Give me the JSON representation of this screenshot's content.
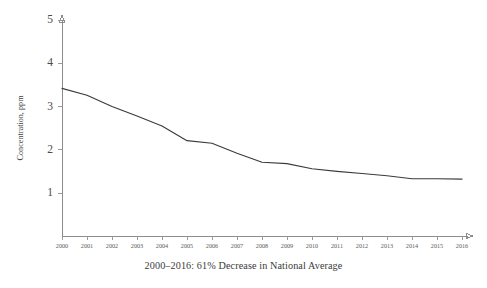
{
  "chart_data": {
    "type": "line",
    "title": "",
    "subtitle": "",
    "caption": "2000–2016:  61% Decrease in National Average",
    "xlabel": "",
    "ylabel": "Concentration, ppm",
    "x": [
      2000,
      2001,
      2002,
      2003,
      2004,
      2005,
      2006,
      2007,
      2008,
      2009,
      2010,
      2011,
      2012,
      2013,
      2014,
      2015,
      2016
    ],
    "categories": [
      "2000",
      "2001",
      "2002",
      "2003",
      "2004",
      "2005",
      "2006",
      "2007",
      "2008",
      "2009",
      "2010",
      "2011",
      "2012",
      "2013",
      "2014",
      "2015",
      "2016"
    ],
    "values": [
      3.42,
      3.26,
      3.0,
      2.78,
      2.55,
      2.21,
      2.15,
      1.92,
      1.71,
      1.68,
      1.56,
      1.5,
      1.45,
      1.4,
      1.33,
      1.33,
      1.32
    ],
    "series": [
      {
        "name": "National Average Concentration",
        "values": [
          3.42,
          3.26,
          3.0,
          2.78,
          2.55,
          2.21,
          2.15,
          1.92,
          1.71,
          1.68,
          1.56,
          1.5,
          1.45,
          1.4,
          1.33,
          1.33,
          1.32
        ]
      }
    ],
    "ylim": [
      0,
      5
    ],
    "xlim": [
      2000,
      2016
    ],
    "yticks": [
      1,
      2,
      3,
      4,
      5
    ],
    "ytick_labels": [
      "1",
      "2",
      "3",
      "4",
      "5"
    ],
    "xticks": [
      2000,
      2001,
      2002,
      2003,
      2004,
      2005,
      2006,
      2007,
      2008,
      2009,
      2010,
      2011,
      2012,
      2013,
      2014,
      2015,
      2016
    ],
    "grid": false,
    "legend": null,
    "legend_position": "none",
    "line_color": "#3b3b3b",
    "axis_color": "#8c8c8c",
    "background_color": "#ffffff",
    "annotations": []
  },
  "axes": {
    "y_axis_title": "Concentration, ppm",
    "x_axis_title": ""
  },
  "footer": {
    "caption": "2000–2016:  61% Decrease in National Average"
  }
}
